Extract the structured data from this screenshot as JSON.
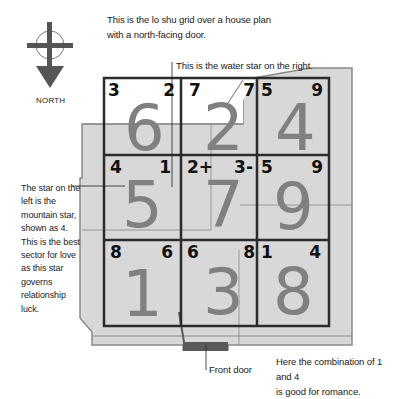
{
  "title_caption": {
    "line1": "This is the lo shu grid over a house plan",
    "line2": "with a north-facing door."
  },
  "water_star_caption": "This is the water star on the right.",
  "mountain_star_caption": {
    "lines": [
      "The star on the",
      "left is the",
      "mountain star,",
      "shown as 4.",
      "This is the best",
      "sector for love",
      "as this star",
      "governs",
      "relationship",
      "luck."
    ]
  },
  "front_door_label": "Front door",
  "romance_caption": {
    "line1": "Here the combination of 1 and 4",
    "line2": "is good for romance."
  },
  "compass": {
    "label": "NORTH",
    "icon": "compass-north-arrow-icon"
  },
  "grid": {
    "cells": [
      {
        "row": 0,
        "col": 0,
        "mountain": "3",
        "water": "2",
        "base": "6"
      },
      {
        "row": 0,
        "col": 1,
        "mountain": "7",
        "water": "7",
        "base": "2"
      },
      {
        "row": 0,
        "col": 2,
        "mountain": "5",
        "water": "9",
        "base": "4"
      },
      {
        "row": 1,
        "col": 0,
        "mountain": "4",
        "water": "1",
        "base": "5"
      },
      {
        "row": 1,
        "col": 1,
        "mountain": "2+",
        "water": "3-",
        "base": "7"
      },
      {
        "row": 1,
        "col": 2,
        "mountain": "5",
        "water": "9",
        "base": "9"
      },
      {
        "row": 2,
        "col": 0,
        "mountain": "8",
        "water": "6",
        "base": "1"
      },
      {
        "row": 2,
        "col": 1,
        "mountain": "6",
        "water": "8",
        "base": "3"
      },
      {
        "row": 2,
        "col": 2,
        "mountain": "1",
        "water": "4",
        "base": "8"
      }
    ]
  },
  "colors": {
    "house_fill": "#d8d8d8",
    "house_outline": "#8a8a8a",
    "grid_line": "#2b2b2b",
    "base_number": "#808080",
    "door": "#5a5a5a"
  }
}
